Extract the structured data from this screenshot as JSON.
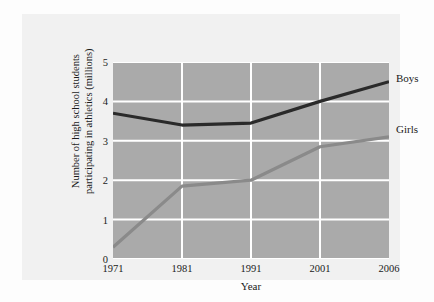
{
  "chart_data": {
    "type": "line",
    "title": "",
    "subtitle": "",
    "xlabel": "Year",
    "ylabel": "Number of high school students participating in athletics (millions)",
    "ylabel_lines": [
      "Number of high school students",
      "participating in athletics (millions)"
    ],
    "categories": [
      "1971",
      "1981",
      "1991",
      "2001",
      "2006"
    ],
    "x_tick_labels": [
      "1971",
      "1981",
      "1991",
      "2001",
      "2006"
    ],
    "y_tick_labels": [
      "0",
      "1",
      "2",
      "3",
      "4",
      "5"
    ],
    "y_tick_values": [
      0,
      1,
      2,
      3,
      4,
      5
    ],
    "ylim": [
      0,
      5
    ],
    "grid": true,
    "grid_color": "#ffffff",
    "plot_background": "#aaaaaa",
    "panel_background": "#f1f1f1",
    "figure_background": "#fdfdfd",
    "legend_position": "right-of-lines",
    "series": [
      {
        "name": "Boys",
        "color": "#2a2a2a",
        "values": [
          3.7,
          3.4,
          3.45,
          4.0,
          4.5
        ],
        "label_value": 4.25
      },
      {
        "name": "Girls",
        "color": "#8a8a8a",
        "values": [
          0.3,
          1.85,
          2.0,
          2.85,
          3.1
        ],
        "label_value": 2.95
      }
    ]
  },
  "axes": {
    "y_title_line1": "Number of high school students",
    "y_title_line2": "participating in athletics (millions)",
    "x_title": "Year"
  },
  "legend": {
    "boys_label": "Boys",
    "girls_label": "Girls"
  }
}
